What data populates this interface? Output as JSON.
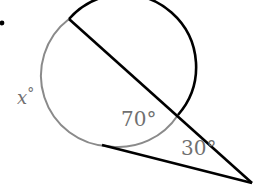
{
  "diagram": {
    "type": "circle-secant-tangent-angle",
    "labels": {
      "arc_x": "x°",
      "arc_x_var": "x",
      "arc_x_deg": "°",
      "arc_inner": "70°",
      "angle_external": "30°"
    },
    "colors": {
      "ink": "#000000",
      "gray_arc": "#808080",
      "label": "#707070",
      "background": "#ffffff"
    }
  }
}
